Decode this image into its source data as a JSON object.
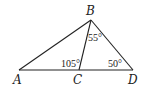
{
  "diagram": {
    "type": "geometry-triangle",
    "points": {
      "A": {
        "label": "A",
        "x": 19,
        "y": 70
      },
      "B": {
        "label": "B",
        "x": 91,
        "y": 20
      },
      "C": {
        "label": "C",
        "x": 79,
        "y": 70
      },
      "D": {
        "label": "D",
        "x": 133,
        "y": 70
      }
    },
    "segments": [
      "AB",
      "BD",
      "AD",
      "BC"
    ],
    "angles": {
      "CBD": "55°",
      "BCA": "105°",
      "BDC": "50°"
    },
    "stroke_color": "#222222"
  }
}
